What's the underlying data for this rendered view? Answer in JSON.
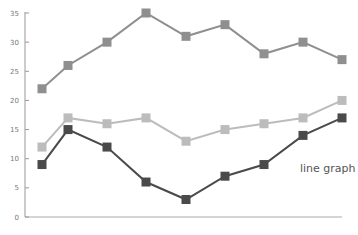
{
  "chart_data": {
    "type": "line",
    "title": "",
    "annotation": "line graph",
    "xlabel": "",
    "ylabel": "",
    "ylim": [
      0,
      35
    ],
    "yticks": [
      0,
      5,
      10,
      15,
      20,
      25,
      30,
      35
    ],
    "x": [
      1,
      2,
      3,
      4,
      5,
      6,
      7,
      8,
      9
    ],
    "grid": false,
    "legend": null,
    "marker": "square",
    "series": [
      {
        "name": "series-1",
        "color": "#8f8f8f",
        "values": [
          22,
          26,
          30,
          35,
          31,
          33,
          28,
          30,
          27
        ]
      },
      {
        "name": "series-2",
        "color": "#bcbcbc",
        "values": [
          12,
          17,
          16,
          17,
          13,
          15,
          16,
          17,
          20
        ]
      },
      {
        "name": "series-3",
        "color": "#4a4a4a",
        "values": [
          9,
          15,
          12,
          6,
          3,
          7,
          9,
          14,
          17
        ]
      }
    ]
  }
}
